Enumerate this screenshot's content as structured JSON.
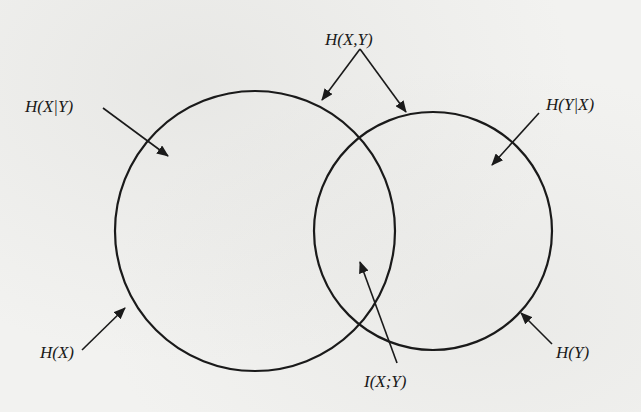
{
  "diagram": {
    "type": "venn",
    "stroke_color": "#1a1a1a",
    "background_color": "#f2f2f0",
    "circles": [
      {
        "id": "X",
        "label": "H(X)",
        "cx": 255,
        "cy": 231,
        "r": 140
      },
      {
        "id": "Y",
        "label": "H(Y)",
        "cx": 433,
        "cy": 231,
        "r": 119
      }
    ],
    "labels": {
      "joint": "H(X,Y)",
      "x_given_y": "H(X|Y)",
      "y_given_x": "H(Y|X)",
      "hx": "H(X)",
      "hy": "H(Y)",
      "mutual": "I(X;Y)"
    },
    "arrows": [
      {
        "from_label": "H(X,Y)",
        "x1": 360,
        "y1": 49,
        "x2": 322,
        "y2": 100
      },
      {
        "from_label": "H(X,Y)",
        "x1": 360,
        "y1": 49,
        "x2": 406,
        "y2": 112
      },
      {
        "from_label": "H(X|Y)",
        "x1": 103,
        "y1": 108,
        "x2": 168,
        "y2": 156
      },
      {
        "from_label": "H(Y|X)",
        "x1": 539,
        "y1": 113,
        "x2": 492,
        "y2": 165
      },
      {
        "from_label": "H(X)",
        "x1": 82,
        "y1": 350,
        "x2": 125,
        "y2": 308
      },
      {
        "from_label": "H(Y)",
        "x1": 552,
        "y1": 344,
        "x2": 521,
        "y2": 313
      },
      {
        "from_label": "I(X;Y)",
        "x1": 397,
        "y1": 363,
        "x2": 360,
        "y2": 262
      }
    ]
  }
}
